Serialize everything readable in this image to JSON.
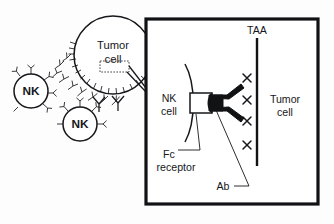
{
  "figure": {
    "background_color": "#fdfdfd",
    "ink_color": "#16171a",
    "width": 334,
    "height": 224
  },
  "overview": {
    "tumor_cell": {
      "label_line1": "Tumor",
      "label_line2": "cell",
      "center": [
        113,
        55
      ],
      "radius": 39
    },
    "nk_cells": [
      {
        "label": "NK",
        "center": [
          31,
          91
        ],
        "radius": 17
      },
      {
        "label": "NK",
        "center": [
          80,
          124
        ],
        "radius": 17
      }
    ],
    "magnified_region_marker": {
      "shape": "dotted-rectangle",
      "x": 100,
      "y": 61,
      "width": 29,
      "height": 11
    }
  },
  "panel": {
    "bounds": {
      "x": 146,
      "y": 19,
      "width": 172,
      "height": 185
    },
    "border_color": "#111214",
    "labels": {
      "taa": "TAA",
      "nk_cell_line1": "NK",
      "nk_cell_line2": "cell",
      "tumor_cell_line1": "Tumor",
      "tumor_cell_line2": "cell",
      "fc_receptor_line1": "Fc",
      "fc_receptor_line2": "receptor",
      "antibody": "Ab"
    },
    "taa_marker_count": 4,
    "antibody_shape": "Y",
    "antibody_fill": "#111214"
  }
}
